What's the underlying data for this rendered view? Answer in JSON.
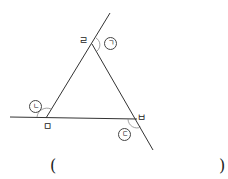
{
  "diagram": {
    "vertices": {
      "top": "ㄹ",
      "left": "ㅁ",
      "right": "ㅂ"
    },
    "angle_marks": {
      "a": "ㄱ",
      "b": "ㄴ",
      "c": "ㄷ"
    },
    "answer": {
      "open_paren": "(",
      "close_paren": ")"
    },
    "colors": {
      "line": "#333333",
      "background": "#ffffff"
    }
  }
}
